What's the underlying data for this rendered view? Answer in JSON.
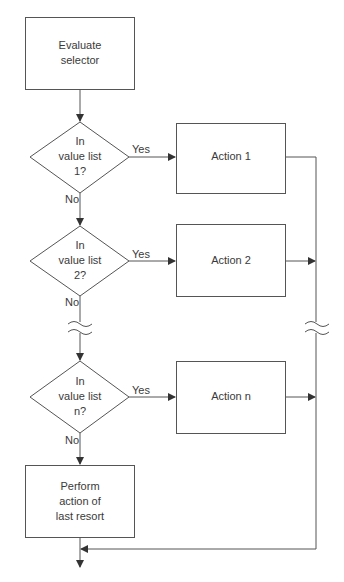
{
  "diagram": {
    "type": "flowchart",
    "colors": {
      "stroke": "#555555",
      "text": "#3a3a3a",
      "background": "#ffffff"
    },
    "nodes": {
      "start": {
        "shape": "rect",
        "text": [
          "Evaluate",
          "selector"
        ]
      },
      "decision1": {
        "shape": "diamond",
        "text": [
          "In",
          "value list",
          "1?"
        ]
      },
      "decision2": {
        "shape": "diamond",
        "text": [
          "In",
          "value list",
          "2?"
        ]
      },
      "decisionN": {
        "shape": "diamond",
        "text": [
          "In",
          "value list",
          "n?"
        ]
      },
      "action1": {
        "shape": "rect",
        "text": [
          "Action 1"
        ]
      },
      "action2": {
        "shape": "rect",
        "text": [
          "Action 2"
        ]
      },
      "actionN": {
        "shape": "rect",
        "text": [
          "Action n"
        ]
      },
      "lastResort": {
        "shape": "rect",
        "text": [
          "Perform",
          "action of",
          "last resort"
        ]
      }
    },
    "edge_labels": {
      "yes1": "Yes",
      "no1": "No",
      "yes2": "Yes",
      "no2": "No",
      "yesN": "Yes",
      "noN": "No"
    },
    "breaks": [
      "left-flow-break",
      "right-flow-break"
    ]
  }
}
